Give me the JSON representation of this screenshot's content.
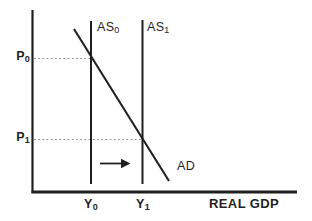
{
  "diagram": {
    "x_axis_label": "REAL GDP",
    "curve_labels": {
      "as0": {
        "base": "AS",
        "sub": "0"
      },
      "as1": {
        "base": "AS",
        "sub": "1"
      },
      "ad": "AD"
    },
    "price_tick_labels": {
      "p0": {
        "base": "P",
        "sub": "0"
      },
      "p1": {
        "base": "P",
        "sub": "1"
      }
    },
    "output_tick_labels": {
      "y0": {
        "base": "Y",
        "sub": "0"
      },
      "y1": {
        "base": "Y",
        "sub": "1"
      }
    },
    "icons": {
      "shift_arrow": "right-arrow"
    },
    "colors": {
      "line": "#1f1f1f",
      "dashed_guide": "#8c8c8c",
      "text": "#1f1f1f",
      "background": "#ffffff"
    }
  }
}
